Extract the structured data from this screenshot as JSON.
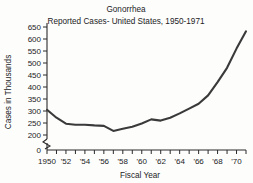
{
  "chart_data": {
    "type": "line",
    "title": "Gonorrhea",
    "subtitle": "Reported Cases- United States, 1950-1971",
    "xlabel": "Fiscal Year",
    "ylabel": "Cases in Thousands",
    "grid": false,
    "legend": "none",
    "xlim": [
      1950,
      1971
    ],
    "ylim": [
      200,
      650
    ],
    "y_axis_break": true,
    "y_axis_break_label": "0",
    "ytick_labels": [
      "650",
      "600",
      "550",
      "500",
      "450",
      "400",
      "350",
      "300",
      "250",
      "200",
      "0"
    ],
    "ytick_values": [
      650,
      600,
      550,
      500,
      450,
      400,
      350,
      300,
      250,
      200,
      0
    ],
    "xtick_labels": [
      "1950",
      "'52",
      "'54",
      "'56",
      "'58",
      "'60",
      "'62",
      "'64",
      "'66",
      "'68",
      "'70"
    ],
    "xtick_values": [
      1950,
      1952,
      1954,
      1956,
      1958,
      1960,
      1962,
      1964,
      1966,
      1968,
      1970
    ],
    "xtick_minor_values": [
      1951,
      1953,
      1955,
      1957,
      1959,
      1961,
      1963,
      1965,
      1967,
      1969,
      1971
    ],
    "series": [
      {
        "name": "Reported Cases",
        "color": "#3a3a3a",
        "x": [
          1950,
          1951,
          1952,
          1953,
          1954,
          1955,
          1956,
          1957,
          1958,
          1959,
          1960,
          1961,
          1962,
          1963,
          1964,
          1965,
          1966,
          1967,
          1968,
          1969,
          1970,
          1971
        ],
        "values": [
          305,
          272,
          247,
          243,
          243,
          240,
          238,
          217,
          226,
          234,
          248,
          265,
          260,
          272,
          290,
          310,
          330,
          365,
          420,
          480,
          560,
          632
        ]
      }
    ]
  },
  "axis_colors": {
    "line": "#2b2b2b",
    "text": "#1c1c1c",
    "series": "#3a3a3a",
    "background": "#fdfdfc"
  }
}
